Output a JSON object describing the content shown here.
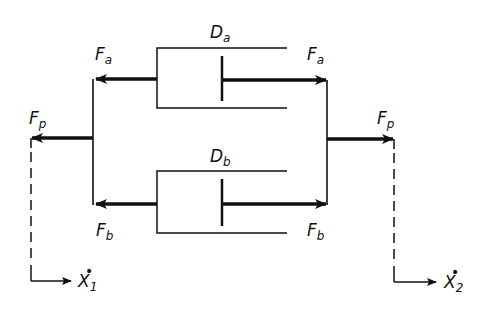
{
  "diagram": {
    "type": "mechanical network: two dampers in parallel",
    "colors": {
      "line": "#111111",
      "background": "#ffffff"
    },
    "dampers": [
      {
        "id": "Da",
        "symbol": "D",
        "sub": "a"
      },
      {
        "id": "Db",
        "symbol": "D",
        "sub": "b"
      }
    ],
    "forces": {
      "fa_left": {
        "symbol": "F",
        "sub": "a"
      },
      "fa_right": {
        "symbol": "F",
        "sub": "a"
      },
      "fb_left": {
        "symbol": "F",
        "sub": "b"
      },
      "fb_right": {
        "symbol": "F",
        "sub": "b"
      },
      "fp_left": {
        "symbol": "F",
        "sub": "p"
      },
      "fp_right": {
        "symbol": "F",
        "sub": "p"
      }
    },
    "velocities": {
      "x1": {
        "symbol": "X",
        "sub": "1",
        "dot": "•"
      },
      "x2": {
        "symbol": "X",
        "sub": "2",
        "dot": "•"
      }
    }
  }
}
